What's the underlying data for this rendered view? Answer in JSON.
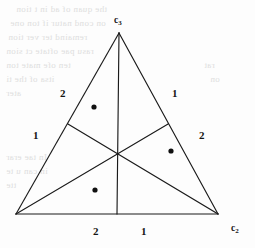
{
  "figure": {
    "type": "simplex-triangle-partition",
    "background_color": "#fdfdfd",
    "stroke_color": "#1a1a1a",
    "point_color": "#101010"
  },
  "vertices": {
    "apex": {
      "label": "c",
      "subscript": "3",
      "x": 119,
      "y": 33
    },
    "bottom_right": {
      "label": "c",
      "subscript": "2",
      "x": 218,
      "y": 214
    },
    "bottom_left": {
      "label": "",
      "subscript": "",
      "x": 16,
      "y": 214
    }
  },
  "axis_labels": [
    {
      "name": "apex-vertex-label",
      "text": "c",
      "subscript": "3",
      "left": 114,
      "top": 16
    },
    {
      "name": "bottom-right-vertex-label",
      "text": "c",
      "subscript": "2",
      "left": 231,
      "top": 224
    }
  ],
  "region_labels": [
    {
      "id": "left-upper",
      "value": "2",
      "left": 60,
      "top": 88
    },
    {
      "id": "right-upper",
      "value": "1",
      "left": 172,
      "top": 88
    },
    {
      "id": "left-lower",
      "value": "1",
      "left": 33,
      "top": 130
    },
    {
      "id": "right-lower",
      "value": "2",
      "left": 199,
      "top": 130
    },
    {
      "id": "bottom-left",
      "value": "2",
      "left": 93,
      "top": 226
    },
    {
      "id": "bottom-right",
      "value": "1",
      "left": 141,
      "top": 226
    }
  ],
  "points": [
    {
      "id": "point-upper-left",
      "x": 94,
      "y": 107,
      "r": 2.6
    },
    {
      "id": "point-mid-right",
      "x": 171,
      "y": 151,
      "r": 2.6
    },
    {
      "id": "point-lower-left",
      "x": 95,
      "y": 190,
      "r": 2.6
    }
  ],
  "triangle_edges": [
    {
      "id": "edge-left",
      "x1": 16,
      "y1": 214,
      "x2": 119,
      "y2": 33
    },
    {
      "id": "edge-right",
      "x1": 119,
      "y1": 33,
      "x2": 218,
      "y2": 214
    },
    {
      "id": "edge-bottom",
      "x1": 16,
      "y1": 214,
      "x2": 218,
      "y2": 214
    }
  ],
  "median_lines": [
    {
      "id": "median-from-apex",
      "x1": 119,
      "y1": 33,
      "x2": 117,
      "y2": 214
    },
    {
      "id": "median-from-bottom-left",
      "x1": 16,
      "y1": 214,
      "x2": 168,
      "y2": 124
    },
    {
      "id": "median-from-bottom-right",
      "x1": 218,
      "y1": 214,
      "x2": 68,
      "y2": 124
    }
  ],
  "midpoints": [
    {
      "id": "midpoint-left-edge",
      "x": 68,
      "y": 124
    },
    {
      "id": "midpoint-right-edge",
      "x": 168,
      "y": 124
    },
    {
      "id": "midpoint-bottom-edge",
      "x": 117,
      "y": 214
    }
  ],
  "bleed_through_text": [
    {
      "id": "bleed-1",
      "text": "the quan of ad in t tion",
      "left": 16,
      "top": 4,
      "size": 9
    },
    {
      "id": "bleed-2",
      "text": "on cond natur if ton one",
      "left": 10,
      "top": 18,
      "size": 9
    },
    {
      "id": "bleed-3",
      "text": "remaind ter ver tion",
      "left": 8,
      "top": 32,
      "size": 9
    },
    {
      "id": "bleed-4",
      "text": "rasu pae oftate ct sion",
      "left": 6,
      "top": 46,
      "size": 9
    },
    {
      "id": "bleed-5",
      "text": "ten ofe mate ton",
      "left": 6,
      "top": 60,
      "size": 9
    },
    {
      "id": "bleed-6",
      "text": "itsa of the ti",
      "left": 6,
      "top": 74,
      "size": 9
    },
    {
      "id": "bleed-7",
      "text": "ater",
      "left": 6,
      "top": 88,
      "size": 9
    },
    {
      "id": "bleed-8",
      "text": "In tae erar",
      "left": 6,
      "top": 152,
      "size": 9
    },
    {
      "id": "bleed-9",
      "text": "in can u te",
      "left": 6,
      "top": 166,
      "size": 9
    },
    {
      "id": "bleed-10",
      "text": "tte",
      "left": 6,
      "top": 180,
      "size": 9
    },
    {
      "id": "bleed-11",
      "text": "rat",
      "left": 204,
      "top": 60,
      "size": 9
    },
    {
      "id": "bleed-12",
      "text": "on",
      "left": 210,
      "top": 74,
      "size": 9
    }
  ]
}
